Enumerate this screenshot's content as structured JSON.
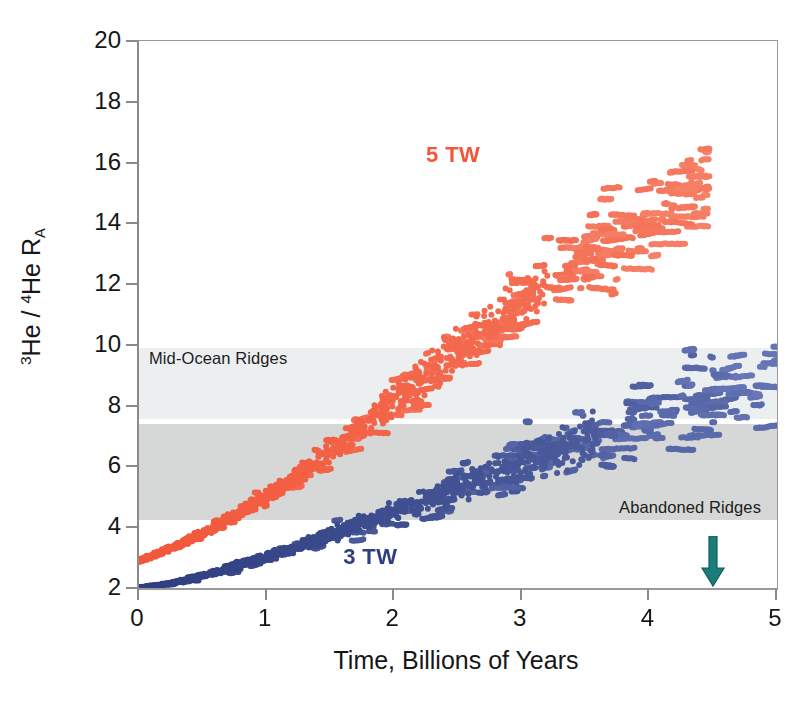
{
  "figure": {
    "width": 809,
    "height": 715,
    "background": "#ffffff"
  },
  "axes": {
    "x_title": "Time, Billions of Years",
    "y_title_html": "3He / 4He RA",
    "y_title_parts": {
      "sup1": "3",
      "he1": "He / ",
      "sup2": "4",
      "he2": "He R",
      "sub": "A"
    },
    "x_ticks": [
      "0",
      "1",
      "2",
      "3",
      "4",
      "5"
    ],
    "y_ticks": [
      "20",
      "18",
      "16",
      "14",
      "12",
      "10",
      "8",
      "6",
      "4",
      "2"
    ],
    "xlim": [
      0,
      5
    ],
    "ylim": [
      2,
      20
    ],
    "tick_color": "#8a8a8a",
    "frame_color": "#9a9a9a"
  },
  "bands": [
    {
      "name": "Mid-Ocean Ridges",
      "label": "Mid-Ocean Ridges",
      "ymin": 9.9,
      "ymax": 7.55,
      "color": "#eceff0",
      "label_position": "top-left"
    },
    {
      "name": "Abandoned Ridges",
      "label": "Abandoned Ridges",
      "ymin": 7.4,
      "ymax": 4.25,
      "color": "#d5d8d6",
      "label_position": "bottom-right"
    }
  ],
  "annotations": {
    "series_5tw": {
      "text": "5 TW",
      "color": "#f2573a",
      "x": 2.25,
      "y": 16.2
    },
    "series_3tw": {
      "text": "3 TW",
      "color": "#2e3e80",
      "x": 1.6,
      "y": 3.0
    },
    "present_day_arrow": {
      "color": "#1b7d7a",
      "x": 4.5,
      "y": 2.0,
      "direction": "down"
    }
  },
  "chart_data": {
    "type": "scatter",
    "title": "",
    "xlabel": "Time, Billions of Years",
    "ylabel": "3He / 4He RA",
    "xlim": [
      0,
      5
    ],
    "ylim": [
      2,
      20
    ],
    "grid": false,
    "legend": "inline-annotations",
    "series": [
      {
        "name": "5 TW",
        "color_start": "#f2573a",
        "color_end": "#f6836a",
        "marker": "circle",
        "marker_size": 3.0,
        "n_points": 2100,
        "description": "Model ensemble for 5 TW heat flow; He ratio rises from ~2.9 at 0 Ga to a spread of ~10-18 at 4.0-4.6 Ga, forming stacked sub-horizontal terraces.",
        "trend_x": [
          0.0,
          0.25,
          0.5,
          0.75,
          1.0,
          1.25,
          1.5,
          1.75,
          2.0,
          2.25,
          2.5,
          2.75,
          3.0,
          3.25,
          3.5,
          3.75,
          4.0,
          4.25,
          4.5,
          4.75,
          5.0
        ],
        "trend_y": [
          2.9,
          3.3,
          3.8,
          4.4,
          5.0,
          5.7,
          6.5,
          7.3,
          8.2,
          9.0,
          9.8,
          10.6,
          11.4,
          12.2,
          12.9,
          13.6,
          14.3,
          15.0,
          15.4,
          15.5,
          15.5
        ],
        "spread_y": [
          0.12,
          0.2,
          0.3,
          0.4,
          0.5,
          0.6,
          0.75,
          0.9,
          1.1,
          1.3,
          1.5,
          1.7,
          1.85,
          2.0,
          2.1,
          2.2,
          2.3,
          2.3,
          2.0,
          1.6,
          1.2
        ],
        "y_min_observed": 2.85,
        "y_max_observed": 17.9,
        "x_range_observed": [
          0.0,
          4.45
        ]
      },
      {
        "name": "3 TW",
        "color_start": "#2e3e80",
        "color_end": "#6878b8",
        "marker": "circle",
        "marker_size": 3.0,
        "n_points": 2100,
        "description": "Model ensemble for 3 TW heat flow; He ratio rises from ~2.0 at 0 Ga to a spread of ~7-12 near 4.6-5.0 Ga, terracing inside and above the Abandoned Ridges band.",
        "trend_x": [
          0.0,
          0.25,
          0.5,
          0.75,
          1.0,
          1.25,
          1.5,
          1.75,
          2.0,
          2.25,
          2.5,
          2.75,
          3.0,
          3.25,
          3.5,
          3.75,
          4.0,
          4.25,
          4.5,
          4.75,
          5.0
        ],
        "trend_y": [
          2.0,
          2.15,
          2.4,
          2.7,
          3.0,
          3.35,
          3.7,
          4.1,
          4.5,
          4.9,
          5.3,
          5.7,
          6.1,
          6.5,
          6.9,
          7.3,
          7.7,
          8.1,
          8.5,
          8.9,
          9.3
        ],
        "spread_y": [
          0.05,
          0.1,
          0.16,
          0.24,
          0.32,
          0.42,
          0.52,
          0.64,
          0.76,
          0.9,
          1.02,
          1.16,
          1.3,
          1.45,
          1.6,
          1.75,
          1.9,
          2.0,
          2.1,
          2.2,
          2.3
        ],
        "y_min_observed": 2.0,
        "y_max_observed": 12.1,
        "x_range_observed": [
          0.0,
          5.0
        ]
      }
    ]
  }
}
